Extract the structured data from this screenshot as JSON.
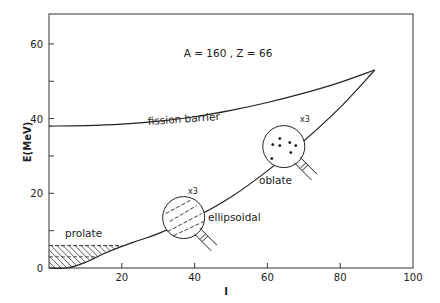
{
  "chart_data": {
    "type": "line",
    "title": "A = 160 ,  Z = 66",
    "xlabel": "I",
    "ylabel": "E(MeV)",
    "xlim": [
      0,
      100
    ],
    "ylim": [
      0,
      68
    ],
    "x_ticks": [
      0,
      20,
      40,
      60,
      80,
      100
    ],
    "x_tick_labels": [
      "",
      "20",
      "40",
      "60",
      "80",
      "100"
    ],
    "y_ticks": [
      0,
      10,
      20,
      30,
      40,
      50,
      60
    ],
    "y_tick_labels": [
      "0",
      "",
      "20",
      "",
      "40",
      "",
      "60"
    ],
    "grid": false,
    "series": [
      {
        "name": "fission barrier",
        "x": [
          0,
          10,
          20,
          30,
          40,
          50,
          60,
          70,
          80,
          89.5
        ],
        "y": [
          38,
          38.1,
          38.5,
          39.3,
          40.5,
          42.2,
          44.3,
          46.8,
          49.7,
          53
        ]
      },
      {
        "name": "yrast line",
        "x": [
          0,
          5,
          10,
          15,
          20,
          25,
          30,
          40,
          50,
          60,
          70,
          80,
          89.5
        ],
        "y": [
          0,
          0,
          1.5,
          3.8,
          5.8,
          7.5,
          9.2,
          13.5,
          19,
          26,
          34,
          43,
          53
        ]
      }
    ],
    "regions": [
      {
        "name": "prolate",
        "label": "prolate",
        "x_range": [
          0,
          20
        ],
        "y_top": 6,
        "style": "hatched"
      }
    ],
    "annotations": [
      {
        "text": "fission barrier",
        "x": 48,
        "y": 40.5
      },
      {
        "text": "prolate",
        "x": 4,
        "y": 7.5
      },
      {
        "text": "ellipsoidal",
        "x": 41,
        "y": 13
      },
      {
        "text": "oblate",
        "x": 61,
        "y": 26
      },
      {
        "text": "x3",
        "x": 37,
        "y": 20.5,
        "note": "magnifier on ellipsoidal region"
      },
      {
        "text": "x3",
        "x": 69,
        "y": 38,
        "note": "magnifier on oblate region"
      }
    ],
    "magnifiers": [
      {
        "name": "ellipsoidal-magnifier",
        "center": [
          37,
          13.5
        ],
        "label": "x3",
        "content": "dashed parallel lines"
      },
      {
        "name": "oblate-magnifier",
        "center": [
          64.5,
          32.5
        ],
        "label": "x3",
        "content": "scattered dots"
      }
    ]
  }
}
